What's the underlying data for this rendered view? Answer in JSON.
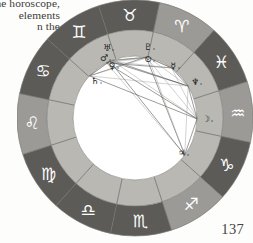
{
  "page": {
    "folio": "137",
    "background_color": "#fdfdfb"
  },
  "text_column_top": {
    "lines": [
      "f the horoscope,",
      "elements",
      "n the",
      "an",
      "a"
    ]
  },
  "text_column_bottom": {
    "lines": [
      "e",
      "n-"
    ]
  },
  "chart_data": {
    "type": "pie",
    "outer_radius": 118,
    "band_inner_radius": 88,
    "inner_disc_radius": 62,
    "rotation_note": "Aries band centered just right of vertical top",
    "colors": {
      "band_dark": "#5d5b58",
      "band_light": "#9b9a96",
      "inner_ring": "#b9b8b3",
      "inner_disc": "#ffffff",
      "glyph_white": "#ffffff",
      "glyph_black": "#1a1a1a",
      "aspect_line": "#4a4a48",
      "spoke_line": "#6f6e6a"
    },
    "zodiac_signs": [
      {
        "name": "Aries",
        "glyph": "♈",
        "shade": "light",
        "index": 0
      },
      {
        "name": "Pisces",
        "glyph": "♓",
        "shade": "dark",
        "index": 1
      },
      {
        "name": "Aquarius",
        "glyph": "♒",
        "shade": "light",
        "index": 2
      },
      {
        "name": "Capricorn",
        "glyph": "♑",
        "shade": "dark",
        "index": 3
      },
      {
        "name": "Sagittarius",
        "glyph": "♐",
        "shade": "light",
        "index": 4
      },
      {
        "name": "Scorpio",
        "glyph": "♏",
        "shade": "dark",
        "index": 5
      },
      {
        "name": "Libra",
        "glyph": "♎",
        "shade": "dark",
        "index": 6
      },
      {
        "name": "Virgo",
        "glyph": "♍",
        "shade": "dark",
        "index": 7
      },
      {
        "name": "Leo",
        "glyph": "♌",
        "shade": "light",
        "index": 8
      },
      {
        "name": "Cancer",
        "glyph": "♋",
        "shade": "dark",
        "index": 9
      },
      {
        "name": "Gemini",
        "glyph": "♊",
        "shade": "dark",
        "index": 10
      },
      {
        "name": "Taurus",
        "glyph": "♉",
        "shade": "dark",
        "index": 11
      }
    ],
    "planets": [
      {
        "name": "Uranus",
        "glyph": "♅",
        "x": 90,
        "y": 51
      },
      {
        "name": "Mars",
        "glyph": "♂",
        "x": 87,
        "y": 61
      },
      {
        "name": "Venus",
        "glyph": "♀",
        "x": 95,
        "y": 69
      },
      {
        "name": "Saturn",
        "glyph": "♄",
        "x": 78,
        "y": 84
      },
      {
        "name": "Pluto",
        "glyph": "♇",
        "x": 131,
        "y": 50
      },
      {
        "name": "Sun",
        "glyph": "⊙",
        "x": 131,
        "y": 62
      },
      {
        "name": "Mercury",
        "glyph": "☿",
        "x": 156,
        "y": 69
      },
      {
        "name": "Neptune",
        "glyph": "♆",
        "x": 178,
        "y": 85
      },
      {
        "name": "Moon",
        "glyph": "☽",
        "x": 189,
        "y": 122
      },
      {
        "name": "Jupiter",
        "glyph": "♃",
        "x": 165,
        "y": 156
      }
    ]
  }
}
